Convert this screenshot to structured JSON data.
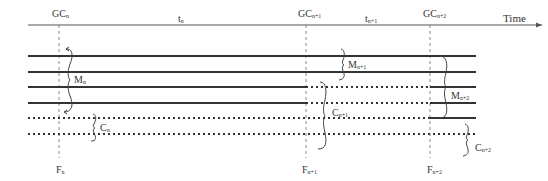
{
  "diagram": {
    "axis_label": "Time",
    "colors": {
      "line": "#333333",
      "guide": "#888888",
      "background": "#ffffff"
    },
    "gc_events": [
      {
        "main": "GC",
        "sub": "n"
      },
      {
        "main": "GC",
        "sub": "n+1"
      },
      {
        "main": "GC",
        "sub": "n+2"
      }
    ],
    "intervals": [
      {
        "main": "t",
        "sub": "n"
      },
      {
        "main": "t",
        "sub": "n+1"
      }
    ],
    "f_labels": [
      {
        "main": "F",
        "sub": "n"
      },
      {
        "main": "F",
        "sub": "n+1"
      },
      {
        "main": "F",
        "sub": "n+2"
      }
    ],
    "m_labels": [
      {
        "main": "M",
        "sub": "n"
      },
      {
        "main": "M",
        "sub": "n+1"
      },
      {
        "main": "M",
        "sub": "n+2"
      }
    ],
    "c_labels": [
      {
        "main": "C",
        "sub": "n"
      },
      {
        "main": "C",
        "sub": "n+1"
      },
      {
        "main": "C",
        "sub": "n+2"
      }
    ],
    "legend": {
      "solid": "live / marked object lines",
      "dotted": "collected object lines"
    }
  }
}
